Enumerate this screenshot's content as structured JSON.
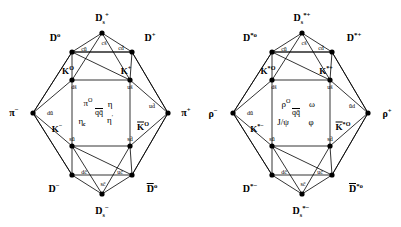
{
  "figure": {
    "background": "#ffffff",
    "line_color": "#000000",
    "vertex_color": "#000000"
  },
  "diagrams": [
    {
      "name": "pseudoscalar-mesons",
      "corners": {
        "top": "D_s^+",
        "upper_left": "D^0",
        "upper_right": "D^+",
        "left": "pi^-",
        "right": "pi^+",
        "lower_left": "D^-",
        "lower_right": "Dbar^0",
        "bottom": "D_s^-",
        "inner_upper_left": "K^0",
        "inner_upper_right": "K^+",
        "inner_lower_left": "K^-",
        "inner_lower_right": "Kbar^0"
      },
      "corner_labels": {
        "top": {
          "base": "D",
          "sub": "s",
          "sup": "+"
        },
        "upper_left": {
          "base": "D",
          "sub": "",
          "sup": "o"
        },
        "upper_right": {
          "base": "D",
          "sub": "",
          "sup": "+"
        },
        "left": {
          "base": "π",
          "sub": "",
          "sup": "−"
        },
        "right": {
          "base": "π",
          "sub": "",
          "sup": "+"
        },
        "lower_left": {
          "base": "D",
          "sub": "",
          "sup": "−"
        },
        "lower_right": {
          "base": "D",
          "sub": "",
          "sup": "o",
          "overline": true
        },
        "bottom": {
          "base": "D",
          "sub": "s",
          "sup": "−"
        },
        "inner_upper_left": {
          "base": "K",
          "sub": "",
          "sup": "O"
        },
        "inner_upper_right": {
          "base": "K",
          "sub": "",
          "sup": "+"
        },
        "inner_lower_left": {
          "base": "K",
          "sub": "",
          "sup": "−"
        },
        "inner_lower_right": {
          "base": "K",
          "sub": "",
          "sup": "O",
          "overline": true
        }
      },
      "quark_content": {
        "top_left_edge": "cū",
        "top_right_edge": "cd̄",
        "upper_inner_left": "ds̄",
        "upper_inner_right": "us̄",
        "left_edge": "dū",
        "right_edge": "ud̄",
        "lower_inner_left": "sū",
        "lower_inner_right": "sd̄",
        "bottom_left_edge": "dc̄",
        "bottom_right_edge": "uc̄",
        "top_vertex": "cs̄",
        "bottom_vertex": "sc̄"
      },
      "center_states": [
        {
          "text": "π",
          "sup": "0"
        },
        {
          "text": "η",
          "sup": ""
        },
        {
          "text": "q",
          "sup": "",
          "note": "qq̄"
        },
        {
          "text": "η",
          "sub": "c"
        },
        {
          "text": "η",
          "sup": "′"
        }
      ],
      "center_center": "qq̄"
    },
    {
      "name": "vector-mesons",
      "corners": {
        "top": "D_s^*+",
        "upper_left": "D^*0",
        "upper_right": "D^*+",
        "left": "rho^-",
        "right": "rho^+",
        "lower_left": "D^*-",
        "lower_right": "Dbar^*0",
        "bottom": "D_s^*-",
        "inner_upper_left": "K^*0",
        "inner_upper_right": "K^*+",
        "inner_lower_left": "K^*-",
        "inner_lower_right": "Kbar^*0"
      },
      "corner_labels": {
        "top": {
          "base": "D",
          "sub": "s",
          "sup": "*+"
        },
        "upper_left": {
          "base": "D",
          "sub": "",
          "sup": "*o"
        },
        "upper_right": {
          "base": "D",
          "sub": "",
          "sup": "*+"
        },
        "left": {
          "base": "ρ",
          "sub": "",
          "sup": "−"
        },
        "right": {
          "base": "ρ",
          "sub": "",
          "sup": "+"
        },
        "lower_left": {
          "base": "D",
          "sub": "",
          "sup": "*−"
        },
        "lower_right": {
          "base": "D",
          "sub": "",
          "sup": "*o",
          "overline": true
        },
        "bottom": {
          "base": "D",
          "sub": "s",
          "sup": "*−"
        },
        "inner_upper_left": {
          "base": "K",
          "sub": "",
          "sup": "*O"
        },
        "inner_upper_right": {
          "base": "K",
          "sub": "",
          "sup": "*+"
        },
        "inner_lower_left": {
          "base": "K",
          "sub": "",
          "sup": "*−"
        },
        "inner_lower_right": {
          "base": "K",
          "sub": "",
          "sup": "*O",
          "overline": true
        }
      },
      "quark_content": {
        "top_left_edge": "cū",
        "top_right_edge": "cd̄",
        "upper_inner_left": "ds̄",
        "upper_inner_right": "us̄",
        "left_edge": "dū",
        "right_edge": "ūd",
        "lower_inner_left": "sū",
        "lower_inner_right": "sd̄",
        "bottom_left_edge": "dc̄",
        "bottom_right_edge": "uc̄",
        "top_vertex": "cs̄",
        "bottom_vertex": "sc̄"
      },
      "center_states": [
        {
          "text": "ρ",
          "sup": "O"
        },
        {
          "text": "ω",
          "sup": ""
        },
        {
          "text": "J/ψ",
          "sup": ""
        },
        {
          "text": "φ",
          "sup": ""
        }
      ],
      "center_center": "qq̄"
    }
  ],
  "left": {
    "c_top": "D",
    "c_top_sub": "s",
    "c_top_sup": "+",
    "c_ul": "D",
    "c_ul_sup": "o",
    "c_ur": "D",
    "c_ur_sup": "+",
    "c_l": "π",
    "c_l_sup": "−",
    "c_r": "π",
    "c_r_sup": "+",
    "c_ll": "D",
    "c_ll_sup": "−",
    "c_lr": "D",
    "c_lr_sup": "o",
    "c_bot": "D",
    "c_bot_sub": "s",
    "c_bot_sup": "−",
    "k_ul": "K",
    "k_ul_sup": "O",
    "k_ur": "K",
    "k_ur_sup": "+",
    "k_ll": "K",
    "k_ll_sup": "−",
    "k_lr": "K",
    "k_lr_sup": "O",
    "q_cs": "cs̄",
    "q_cu": "cū",
    "q_cd": "cd̄",
    "q_ds": "ds̄",
    "q_us": "us̄",
    "q_du": "dū",
    "q_ud": "ud̄",
    "q_su": "sū",
    "q_sd": "sd̄",
    "q_dc": "dc̄",
    "q_uc": "uc̄",
    "q_sc": "sc̄",
    "m_pi": "π",
    "m_pi_sup": "O",
    "m_eta": "η",
    "m_qq": "qq̄",
    "m_etac": "η",
    "m_etac_sub": "c",
    "m_etap": "η",
    "m_etap_sup": "′"
  },
  "right": {
    "c_top": "D",
    "c_top_sub": "s",
    "c_top_sup": "*+",
    "c_ul": "D",
    "c_ul_sup": "*o",
    "c_ur": "D",
    "c_ur_sup": "*+",
    "c_l": "ρ",
    "c_l_sup": "−",
    "c_r": "ρ",
    "c_r_sup": "+",
    "c_ll": "D",
    "c_ll_sup": "*−",
    "c_lr": "D",
    "c_lr_sup": "*o",
    "c_bot": "D",
    "c_bot_sub": "s",
    "c_bot_sup": "*−",
    "k_ul": "K",
    "k_ul_sup": "*O",
    "k_ur": "K",
    "k_ur_sup": "*+",
    "k_ll": "K",
    "k_ll_sup": "*−",
    "k_lr": "K",
    "k_lr_sup": "*O",
    "q_cs": "cs̄",
    "q_cu": "cū",
    "q_cd": "cd̄",
    "q_ds": "ds̄",
    "q_us": "us̄",
    "q_du": "dū",
    "q_ud": "ūd",
    "q_su": "sū",
    "q_sd": "sd̄",
    "q_dc": "dc̄",
    "q_uc": "uc̄",
    "q_sc": "sc̄",
    "m_rho": "ρ",
    "m_rho_sup": "O",
    "m_omega": "ω",
    "m_qq": "qq̄",
    "m_jpsi": "J/ψ",
    "m_phi": "φ"
  }
}
